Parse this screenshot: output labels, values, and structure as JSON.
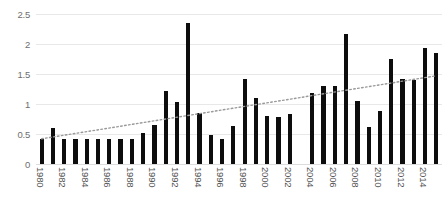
{
  "chart_data": {
    "type": "bar",
    "title": "",
    "subtitle": "",
    "xlabel": "",
    "ylabel": "",
    "ylim": [
      0,
      2.5
    ],
    "ytick_labels": [
      "0",
      "0.5",
      "1",
      "1.5",
      "2",
      "2.5"
    ],
    "ytick_values": [
      0,
      0.5,
      1,
      1.5,
      2,
      2.5
    ],
    "grid": true,
    "legend": "none",
    "bar_color": "#0d0d0d",
    "gridline_color": "#e8e8e8",
    "background_color": "#ffffff",
    "categories": [
      "1980",
      "1981",
      "1982",
      "1983",
      "1984",
      "1985",
      "1986",
      "1987",
      "1988",
      "1989",
      "1990",
      "1991",
      "1992",
      "1993",
      "1994",
      "1995",
      "1996",
      "1997",
      "1998",
      "1999",
      "2000",
      "2001",
      "2002",
      "2003",
      "2004",
      "2005",
      "2006",
      "2007",
      "2008",
      "2009",
      "2010",
      "2011",
      "2012",
      "2013",
      "2014",
      "2015"
    ],
    "values": [
      0.42,
      0.6,
      0.42,
      0.42,
      0.42,
      0.42,
      0.42,
      0.42,
      0.42,
      0.52,
      0.65,
      1.22,
      1.04,
      2.35,
      0.85,
      0.48,
      0.42,
      0.63,
      1.42,
      1.1,
      0.8,
      0.78,
      0.84,
      null,
      1.18,
      1.3,
      1.3,
      2.17,
      1.05,
      0.62,
      0.88,
      1.75,
      1.42,
      1.4,
      1.93,
      1.85
    ],
    "xtick_labels_shown": [
      "1980",
      "1982",
      "1984",
      "1986",
      "1988",
      "1990",
      "1992",
      "1994",
      "1996",
      "1998",
      "2000",
      "2002",
      "2004",
      "2006",
      "2008",
      "2010",
      "2012",
      "2014"
    ],
    "trendline": {
      "style": "dotted",
      "color": "#9a9a9a",
      "start_value": 0.42,
      "end_value": 1.47
    }
  }
}
